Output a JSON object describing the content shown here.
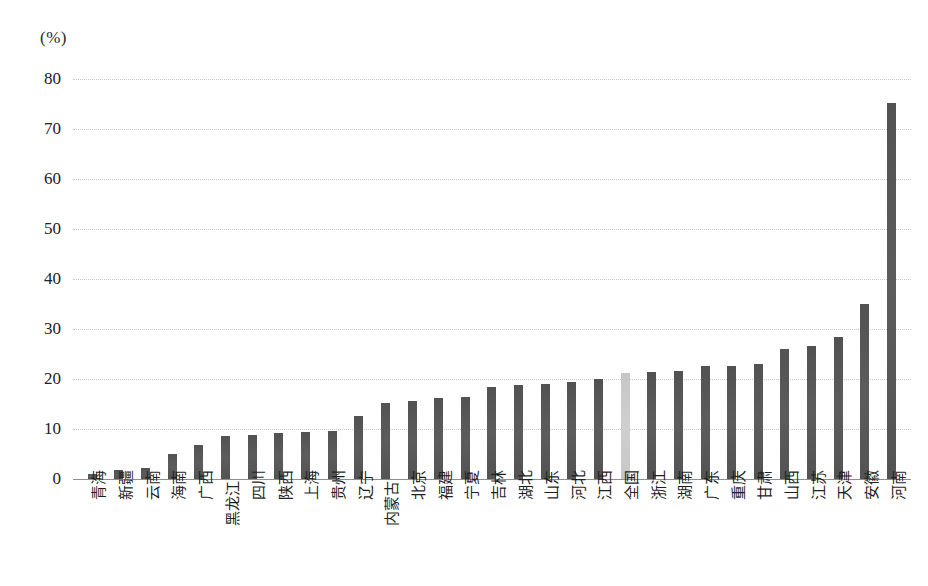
{
  "axis": {
    "unit_label": "(%)",
    "y_ticks": [
      "80",
      "70",
      "60",
      "50",
      "40",
      "30",
      "20",
      "10",
      "0"
    ]
  },
  "colors": {
    "bar": "#555555",
    "highlight_bar": "#c9c9c9",
    "gridline": "#c9c9c9",
    "axis": "#8e8e8e"
  },
  "chart_data": {
    "type": "bar",
    "title": "",
    "xlabel": "",
    "ylabel": "(%)",
    "ylim": [
      0,
      80
    ],
    "ytick_step": 10,
    "grid": true,
    "legend": "none",
    "highlight_category": "全国",
    "categories": [
      "青海",
      "新疆",
      "云南",
      "海南",
      "广西",
      "黑龙江",
      "四川",
      "陕西",
      "上海",
      "贵州",
      "辽宁",
      "内蒙古",
      "北京",
      "福建",
      "宁夏",
      "吉林",
      "湖北",
      "山东",
      "河北",
      "江西",
      "全国",
      "浙江",
      "湖南",
      "广东",
      "重庆",
      "甘肃",
      "山西",
      "江苏",
      "天津",
      "安徽",
      "河南"
    ],
    "values": [
      1.0,
      1.8,
      2.2,
      5.0,
      6.9,
      8.6,
      8.8,
      9.2,
      9.4,
      9.6,
      12.7,
      15.3,
      15.7,
      16.3,
      16.5,
      18.4,
      18.8,
      19.0,
      19.5,
      20.1,
      21.2,
      21.5,
      21.7,
      22.6,
      22.7,
      23.0,
      26.0,
      26.6,
      28.4,
      35.0,
      75.2
    ],
    "drop_labels": [
      "黑龙江",
      "内蒙古"
    ]
  }
}
